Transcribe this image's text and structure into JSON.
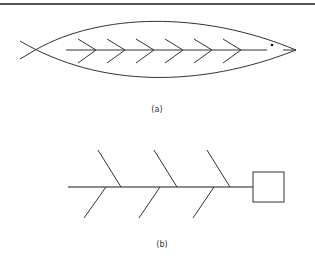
{
  "figure_a": {
    "label": "(a)",
    "description": "Fish-shaped outline with a central spine and six chevron bones"
  },
  "figure_b": {
    "label": "(b)",
    "description": "Fishbone (Ishikawa) diagram skeleton with a spine, six diagonal bones, and an effect box"
  },
  "colors": {
    "stroke": "#333333",
    "spine_b": "#666666",
    "background": "#ffffff"
  }
}
